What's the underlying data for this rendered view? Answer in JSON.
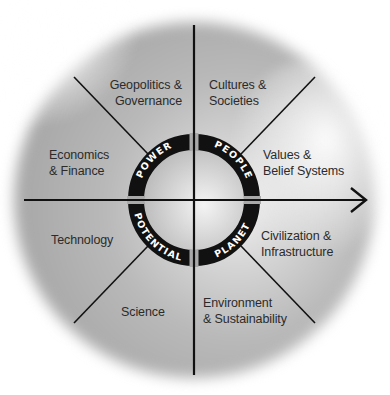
{
  "diagram": {
    "type": "radial-quadrant framework",
    "center_ring": {
      "quadrants": [
        {
          "id": "top-left",
          "label": "POWER"
        },
        {
          "id": "top-right",
          "label": "PEOPLE"
        },
        {
          "id": "bottom-left",
          "label": "POTENTIAL"
        },
        {
          "id": "bottom-right",
          "label": "PLANET"
        }
      ]
    },
    "sectors": [
      {
        "id": "geopolitics",
        "label": "Geopolitics &\nGovernance",
        "quadrant": "POWER"
      },
      {
        "id": "economics",
        "label": "Economics\n& Finance",
        "quadrant": "POWER"
      },
      {
        "id": "cultures",
        "label": "Cultures &\nSocieties",
        "quadrant": "PEOPLE"
      },
      {
        "id": "values",
        "label": "Values &\nBelief Systems",
        "quadrant": "PEOPLE"
      },
      {
        "id": "technology",
        "label": "Technology",
        "quadrant": "POTENTIAL"
      },
      {
        "id": "science",
        "label": "Science",
        "quadrant": "POTENTIAL"
      },
      {
        "id": "civilization",
        "label": "Civilization &\nInfrastructure",
        "quadrant": "PLANET"
      },
      {
        "id": "environment",
        "label": "Environment\n& Sustainability",
        "quadrant": "PLANET"
      }
    ],
    "axes": {
      "horizontal": "arrow pointing right",
      "vertical": "line"
    },
    "colors": {
      "ring": "#111111",
      "lines": "#111111",
      "text": "#2b2b2b",
      "ring_text": "#ffffff",
      "disc": "#b0b0b0"
    }
  }
}
